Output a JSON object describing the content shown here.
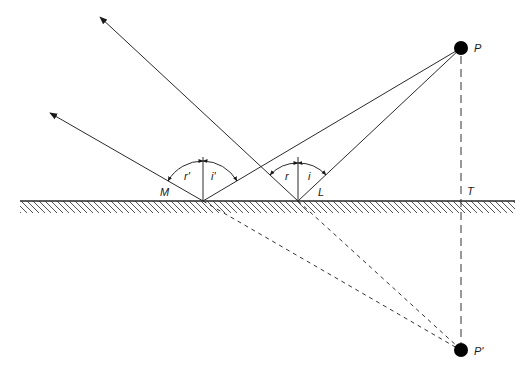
{
  "figure": {
    "colors": {
      "line": "#2a2a2a",
      "point": "#000000",
      "background": "#ffffff"
    },
    "labels": {
      "P": "P",
      "P_prime": "P'",
      "T": "T",
      "L": "L",
      "M": "M",
      "r": "r",
      "i": "i",
      "r_prime": "r'",
      "i_prime": "i'"
    },
    "points": {
      "P": {
        "x": 461,
        "y": 48
      },
      "P_prime": {
        "x": 461,
        "y": 350
      },
      "T": {
        "x": 461,
        "y": 201
      },
      "L": {
        "x": 298,
        "y": 201
      },
      "M": {
        "x": 203,
        "y": 201
      }
    },
    "surface": {
      "y": 201,
      "x_start": 20,
      "x_end": 515,
      "hatched": true
    },
    "rays": [
      {
        "name": "incident-to-L",
        "from": "P",
        "to": "L",
        "style": "solid"
      },
      {
        "name": "reflected-from-L",
        "from": "L",
        "to": [
          100,
          17
        ],
        "style": "solid-arrow"
      },
      {
        "name": "incident-to-M",
        "from": "P",
        "to": "M",
        "style": "solid"
      },
      {
        "name": "reflected-from-M",
        "from": "M",
        "to": [
          50,
          113
        ],
        "style": "solid-arrow"
      },
      {
        "name": "virtual-L",
        "from": "L",
        "to": "P_prime",
        "style": "dashed"
      },
      {
        "name": "virtual-M",
        "from": "M",
        "to": "P_prime",
        "style": "dashed"
      },
      {
        "name": "perpendicular-PT",
        "from": "P",
        "to": "P_prime",
        "style": "long-dashed"
      }
    ]
  }
}
